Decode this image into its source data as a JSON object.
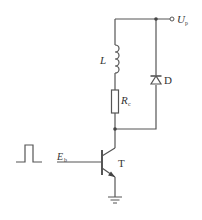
{
  "diagram": {
    "type": "circuit-schematic",
    "labels": {
      "supply": "U",
      "supply_sub": "p",
      "inductor": "L",
      "resistor": "R",
      "resistor_sub": "c",
      "diode": "D",
      "base_input": "E",
      "base_input_sub": "b",
      "transistor": "T"
    },
    "components": [
      {
        "id": "L",
        "kind": "inductor"
      },
      {
        "id": "Rc",
        "kind": "resistor"
      },
      {
        "id": "D",
        "kind": "diode"
      },
      {
        "id": "T",
        "kind": "npn-transistor"
      },
      {
        "id": "pulse",
        "kind": "square-pulse-source"
      },
      {
        "id": "ground",
        "kind": "ground"
      },
      {
        "id": "Up",
        "kind": "supply-terminal"
      }
    ],
    "colors": {
      "wire": "#555555",
      "text": "#333333"
    }
  }
}
